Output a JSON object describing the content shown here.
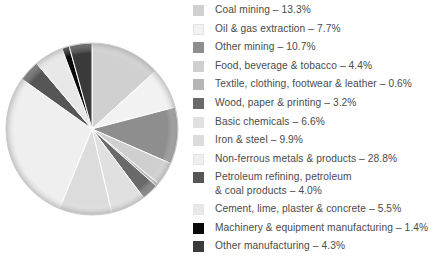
{
  "chart_data": {
    "type": "pie",
    "title": "",
    "subtitle": "",
    "xlabel": "",
    "ylabel": "",
    "legend_position": "right",
    "grid": false,
    "units": "percent",
    "start_angle_deg": 0,
    "direction": "clockwise",
    "categories": [
      "Coal mining",
      "Oil & gas extraction",
      "Other mining",
      "Food, beverage & tobacco",
      "Textile, clothing, footwear & leather",
      "Wood, paper & printing",
      "Basic chemicals",
      "Iron & steel",
      "Non-ferrous metals & products",
      "Petroleum refining, petroleum\n& coal products",
      "Cement, lime, plaster & concrete",
      "Machinery & equipment manufacturing",
      "Other manufacturing"
    ],
    "values": [
      13.3,
      7.7,
      10.7,
      4.4,
      0.6,
      3.2,
      6.6,
      9.9,
      28.8,
      4.0,
      5.5,
      1.4,
      4.3
    ],
    "colors": [
      "#d0d0d0",
      "#f2f2f2",
      "#8e8e8e",
      "#cfcfcf",
      "#b6b6b6",
      "#6a6a6a",
      "#e0e0e0",
      "#dcdcdc",
      "#efefef",
      "#565656",
      "#e8e8e8",
      "#0a0a0a",
      "#3a3a3a"
    ],
    "labels": [
      "Coal mining – 13.3%",
      "Oil & gas extraction – 7.7%",
      "Other mining – 10.7%",
      "Food, beverage & tobacco – 4.4%",
      "Textile, clothing, footwear & leather – 0.6%",
      "Wood, paper & printing – 3.2%",
      "Basic chemicals – 6.6%",
      "Iron & steel – 9.9%",
      "Non-ferrous metals & products – 28.8%",
      "Petroleum refining, petroleum\n& coal products – 4.0%",
      "Cement, lime, plaster & concrete – 5.5%",
      "Machinery & equipment manufacturing – 1.4%",
      "Other manufacturing – 4.3%"
    ]
  },
  "legend": {
    "items": [
      {
        "label": "Coal mining – 13.3%",
        "color": "#d0d0d0",
        "value": 13.3
      },
      {
        "label": "Oil & gas extraction – 7.7%",
        "color": "#f2f2f2",
        "value": 7.7
      },
      {
        "label": "Other mining – 10.7%",
        "color": "#8e8e8e",
        "value": 10.7
      },
      {
        "label": "Food, beverage & tobacco – 4.4%",
        "color": "#cfcfcf",
        "value": 4.4
      },
      {
        "label": "Textile, clothing, footwear & leather – 0.6%",
        "color": "#b6b6b6",
        "value": 0.6
      },
      {
        "label": "Wood, paper & printing – 3.2%",
        "color": "#6a6a6a",
        "value": 3.2
      },
      {
        "label": "Basic chemicals – 6.6%",
        "color": "#e0e0e0",
        "value": 6.6
      },
      {
        "label": "Iron & steel – 9.9%",
        "color": "#dcdcdc",
        "value": 9.9
      },
      {
        "label": "Non-ferrous metals & products – 28.8%",
        "color": "#efefef",
        "value": 28.8
      },
      {
        "label": "Petroleum refining, petroleum\n& coal products – 4.0%",
        "color": "#565656",
        "value": 4.0
      },
      {
        "label": "Cement, lime, plaster & concrete – 5.5%",
        "color": "#e8e8e8",
        "value": 5.5
      },
      {
        "label": "Machinery & equipment manufacturing – 1.4%",
        "color": "#0a0a0a",
        "value": 1.4
      },
      {
        "label": "Other manufacturing – 4.3%",
        "color": "#3a3a3a",
        "value": 4.3
      }
    ]
  },
  "geometry": {
    "center_x": 92,
    "center_y": 129,
    "radius": 86
  },
  "style": {
    "background": "#ffffff",
    "text_color": "#4a4a4a",
    "slice_stroke": "#ffffff",
    "rim_color": "#c8c8c8"
  }
}
